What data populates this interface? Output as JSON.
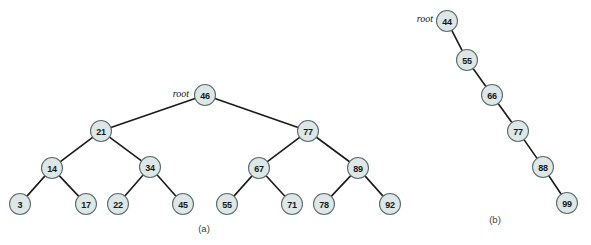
{
  "figure": {
    "background_color": "#ffffff",
    "node_fill_color": "#dde7e7",
    "node_stroke_color": "#5d6d6d",
    "edge_color": "#1a1a1a",
    "node_radius": 10.5
  },
  "panels": [
    {
      "id": "panel-a",
      "caption": "(a)",
      "caption_pos": {
        "x": 204,
        "y": 228
      },
      "root_label": "root",
      "root_label_pos": {
        "x": 189,
        "y": 93
      },
      "nodes": [
        {
          "id": "a46",
          "label": "46",
          "x": 205,
          "y": 95
        },
        {
          "id": "a21",
          "label": "21",
          "x": 101,
          "y": 131
        },
        {
          "id": "a77",
          "label": "77",
          "x": 308,
          "y": 131
        },
        {
          "id": "a14",
          "label": "14",
          "x": 52,
          "y": 168
        },
        {
          "id": "a34",
          "label": "34",
          "x": 150,
          "y": 167
        },
        {
          "id": "a67",
          "label": "67",
          "x": 259,
          "y": 168
        },
        {
          "id": "a89",
          "label": "89",
          "x": 358,
          "y": 168
        },
        {
          "id": "a3",
          "label": "3",
          "x": 20,
          "y": 204
        },
        {
          "id": "a17",
          "label": "17",
          "x": 86,
          "y": 204
        },
        {
          "id": "a22",
          "label": "22",
          "x": 118,
          "y": 204
        },
        {
          "id": "a45",
          "label": "45",
          "x": 183,
          "y": 204
        },
        {
          "id": "a55",
          "label": "55",
          "x": 227,
          "y": 204
        },
        {
          "id": "a71",
          "label": "71",
          "x": 292,
          "y": 204
        },
        {
          "id": "a78",
          "label": "78",
          "x": 324,
          "y": 204
        },
        {
          "id": "a92",
          "label": "92",
          "x": 390,
          "y": 204
        }
      ],
      "edges": [
        {
          "from": "a46",
          "to": "a21"
        },
        {
          "from": "a46",
          "to": "a77"
        },
        {
          "from": "a21",
          "to": "a14"
        },
        {
          "from": "a21",
          "to": "a34"
        },
        {
          "from": "a77",
          "to": "a67"
        },
        {
          "from": "a77",
          "to": "a89"
        },
        {
          "from": "a14",
          "to": "a3"
        },
        {
          "from": "a14",
          "to": "a17"
        },
        {
          "from": "a34",
          "to": "a22"
        },
        {
          "from": "a34",
          "to": "a45"
        },
        {
          "from": "a67",
          "to": "a55"
        },
        {
          "from": "a67",
          "to": "a71"
        },
        {
          "from": "a89",
          "to": "a78"
        },
        {
          "from": "a89",
          "to": "a92"
        }
      ]
    },
    {
      "id": "panel-b",
      "caption": "(b)",
      "caption_pos": {
        "x": 495,
        "y": 219
      },
      "root_label": "root",
      "root_label_pos": {
        "x": 433,
        "y": 18
      },
      "nodes": [
        {
          "id": "b44",
          "label": "44",
          "x": 447,
          "y": 21
        },
        {
          "id": "b55",
          "label": "55",
          "x": 467,
          "y": 60
        },
        {
          "id": "b66",
          "label": "66",
          "x": 492,
          "y": 95
        },
        {
          "id": "b77",
          "label": "77",
          "x": 518,
          "y": 131
        },
        {
          "id": "b88",
          "label": "88",
          "x": 543,
          "y": 167
        },
        {
          "id": "b99",
          "label": "99",
          "x": 567,
          "y": 203
        }
      ],
      "edges": [
        {
          "from": "b44",
          "to": "b55"
        },
        {
          "from": "b55",
          "to": "b66"
        },
        {
          "from": "b66",
          "to": "b77"
        },
        {
          "from": "b77",
          "to": "b88"
        },
        {
          "from": "b88",
          "to": "b99"
        }
      ]
    }
  ]
}
